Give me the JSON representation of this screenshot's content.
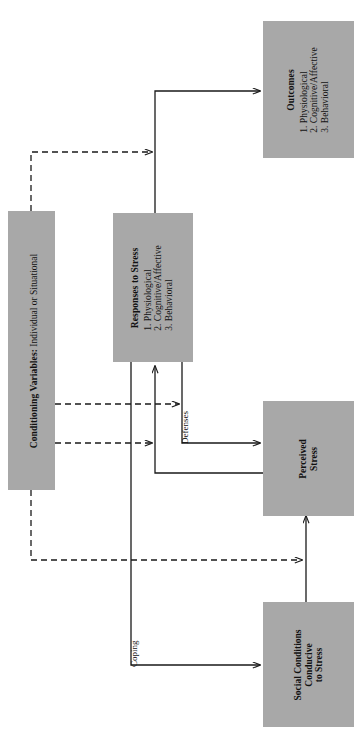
{
  "figure": {
    "orientation": "rotated-90-ccw",
    "box_fill": "#a8a8a8",
    "line_color": "#1a1a1a",
    "background": "#ffffff"
  },
  "nodes": {
    "outcomes": {
      "title": "Outcomes",
      "items": [
        "1.  Physiological",
        "2.  Cognitive/Affective",
        "3.  Behavioral"
      ]
    },
    "responses": {
      "title": "Responses to Stress",
      "items": [
        "1.  Physiological",
        "2.  Cognitive/Affective",
        "3.  Behavioral"
      ]
    },
    "conditioning": {
      "title": "Conditioning Variables:",
      "subtitle": " Individual or Situational"
    },
    "perceived": {
      "line1": "Perceived",
      "line2": "Stress"
    },
    "social": {
      "line1": "Social Conditions",
      "line2": "Conducive",
      "line3": "to Stress"
    }
  },
  "edge_labels": {
    "defenses": "Defenses",
    "coping": "Coping"
  }
}
